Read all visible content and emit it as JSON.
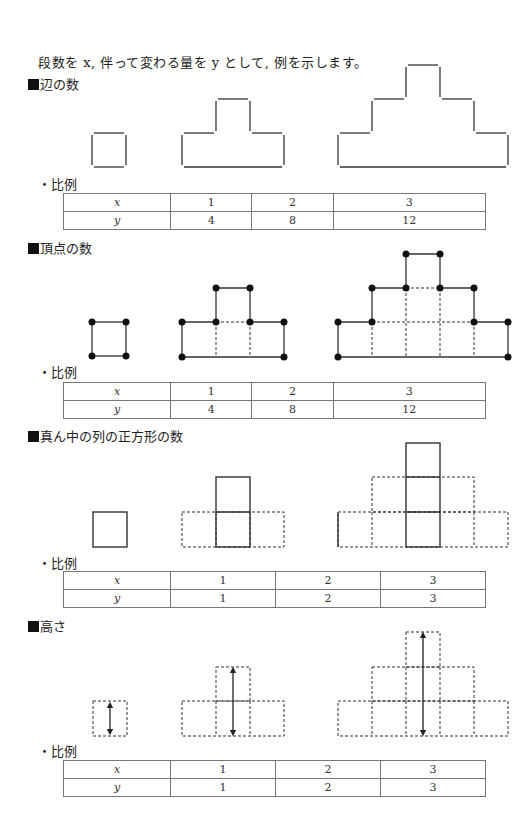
{
  "intro": "段数を x, 伴って変わる量を y として, 例を示します。",
  "sections": [
    {
      "title": "辺の数",
      "label": "・比例",
      "table": {
        "x_label": "x",
        "y_label": "y",
        "x": [
          "1",
          "2",
          "3"
        ],
        "y": [
          "4",
          "8",
          "12"
        ]
      }
    },
    {
      "title": "頂点の数",
      "label": "・比例",
      "table": {
        "x_label": "x",
        "y_label": "y",
        "x": [
          "1",
          "2",
          "3"
        ],
        "y": [
          "4",
          "8",
          "12"
        ]
      }
    },
    {
      "title": "真ん中の列の正方形の数",
      "label": "・比例",
      "table": {
        "x_label": "x",
        "y_label": "y",
        "x": [
          "1",
          "2",
          "3"
        ],
        "y": [
          "1",
          "2",
          "3"
        ]
      }
    },
    {
      "title": "高さ",
      "label": "・比例",
      "table": {
        "x_label": "x",
        "y_label": "y",
        "x": [
          "1",
          "2",
          "3"
        ],
        "y": [
          "1",
          "2",
          "3"
        ]
      }
    }
  ],
  "colors": {
    "line": "#333333",
    "table_border": "#777777",
    "text": "#222222"
  }
}
